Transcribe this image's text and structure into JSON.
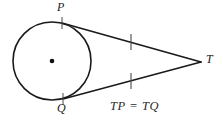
{
  "figure": {
    "width": 223,
    "height": 123,
    "background_color": "#ffffff",
    "stroke_color": "#1a1a1a"
  },
  "labels": {
    "point_p": "P",
    "point_q": "Q",
    "point_t": "T",
    "caption": "TP = TQ"
  },
  "geometry": {
    "circle": {
      "cx": 52,
      "cy": 61,
      "r": 39
    },
    "center_dot": {
      "cx": 52,
      "cy": 61,
      "r": 2.2
    },
    "tangent_point_p": {
      "x": 62,
      "y": 23
    },
    "tangent_point_q": {
      "x": 63,
      "y": 99
    },
    "external_point_t": {
      "x": 201,
      "y": 62
    },
    "tick_upper": {
      "x": 131,
      "y": 42
    },
    "tick_lower": {
      "x": 131,
      "y": 81
    }
  }
}
